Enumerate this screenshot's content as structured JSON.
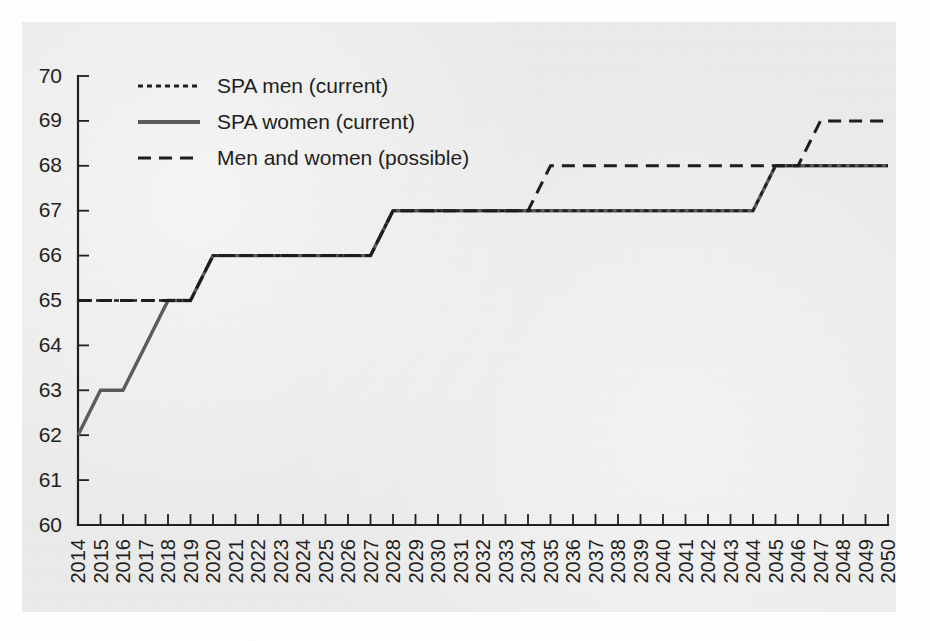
{
  "chart_data": {
    "type": "line",
    "title": "",
    "subtitle": "",
    "xlabel": "",
    "ylabel": "",
    "xlim": [
      2014,
      2050
    ],
    "ylim": [
      60,
      70
    ],
    "yticks": [
      60,
      61,
      62,
      63,
      64,
      65,
      66,
      67,
      68,
      69,
      70
    ],
    "ytick_labels": [
      "60",
      "61",
      "62",
      "63",
      "64",
      "65",
      "66",
      "67",
      "68",
      "69",
      "70"
    ],
    "grid": false,
    "legend_position": "upper-left",
    "x": [
      2014,
      2015,
      2016,
      2017,
      2018,
      2019,
      2020,
      2021,
      2022,
      2023,
      2024,
      2025,
      2026,
      2027,
      2028,
      2029,
      2030,
      2031,
      2032,
      2033,
      2034,
      2035,
      2036,
      2037,
      2038,
      2039,
      2040,
      2041,
      2042,
      2043,
      2044,
      2045,
      2046,
      2047,
      2048,
      2049,
      2050
    ],
    "xtick_labels": [
      "2014",
      "2015",
      "2016",
      "2017",
      "2018",
      "2019",
      "2020",
      "2021",
      "2022",
      "2023",
      "2024",
      "2025",
      "2026",
      "2027",
      "2028",
      "2029",
      "2030",
      "2031",
      "2032",
      "2033",
      "2034",
      "2035",
      "2036",
      "2037",
      "2038",
      "2039",
      "2040",
      "2041",
      "2042",
      "2043",
      "2044",
      "2045",
      "2046",
      "2047",
      "2048",
      "2049",
      "2050"
    ],
    "series": [
      {
        "name": "SPA men (current)",
        "style": "dotted",
        "color": "#1d1d1d",
        "values": [
          65,
          65,
          65,
          65,
          65,
          65,
          66,
          66,
          66,
          66,
          66,
          66,
          66,
          66,
          67,
          67,
          67,
          67,
          67,
          67,
          67,
          67,
          67,
          67,
          67,
          67,
          67,
          67,
          67,
          67,
          67,
          68,
          68,
          68,
          68,
          68,
          68
        ]
      },
      {
        "name": "SPA women (current)",
        "style": "solid",
        "color": "#5c5c5c",
        "values": [
          62,
          63,
          63,
          64,
          65,
          65,
          66,
          66,
          66,
          66,
          66,
          66,
          66,
          66,
          67,
          67,
          67,
          67,
          67,
          67,
          67,
          67,
          67,
          67,
          67,
          67,
          67,
          67,
          67,
          67,
          67,
          68,
          68,
          68,
          68,
          68,
          68
        ]
      },
      {
        "name": "Men and women (possible)",
        "style": "dashed",
        "color": "#1d1d1d",
        "values": [
          65,
          65,
          65,
          65,
          65,
          65,
          66,
          66,
          66,
          66,
          66,
          66,
          66,
          66,
          67,
          67,
          67,
          67,
          67,
          67,
          67,
          68,
          68,
          68,
          68,
          68,
          68,
          68,
          68,
          68,
          68,
          68,
          68,
          69,
          69,
          69,
          69
        ]
      }
    ]
  },
  "legend": {
    "entries": [
      {
        "label": "SPA men (current)",
        "swatch": "dotted-line-swatch"
      },
      {
        "label": "SPA women (current)",
        "swatch": "solid-line-swatch"
      },
      {
        "label": "Men and women (possible)",
        "swatch": "dashed-line-swatch"
      }
    ]
  },
  "colors": {
    "axis": "#231f20",
    "panel_background": "#ebebeb",
    "women_line": "#5c5c5c",
    "men_line": "#1d1d1d",
    "possible_line": "#1d1d1d"
  }
}
